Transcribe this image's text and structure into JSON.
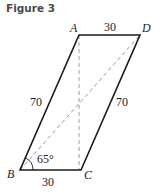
{
  "figure": {
    "title": "Figure 3",
    "vertices": {
      "A": {
        "label": "A"
      },
      "B": {
        "label": "B"
      },
      "C": {
        "label": "C"
      },
      "D": {
        "label": "D"
      }
    },
    "side_labels": {
      "AD": "30",
      "BC": "30",
      "AB": "70",
      "CD": "70"
    },
    "angle_label": "65°",
    "colors": {
      "solid": "#1a1a1a",
      "dashed": "#9a9a9a"
    }
  }
}
